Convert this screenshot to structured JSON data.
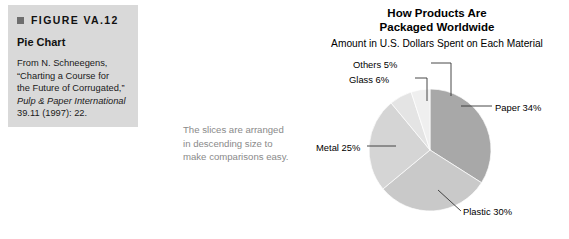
{
  "figure": {
    "marker": "square-bullet-icon",
    "number": "FIGURE VA.12",
    "title": "Pie Chart",
    "credit_line1": "From N. Schneegens,",
    "credit_line2": "“Charting a Course for",
    "credit_line3": "the Future of Corrugated,”",
    "credit_source": "Pulp & Paper International",
    "credit_line4": "39.11 (1997): 22."
  },
  "annotation": {
    "line1": "The slices are arranged",
    "line2": "in descending size to",
    "line3": "make comparisons easy."
  },
  "chart_data": {
    "type": "pie",
    "title": "How Products Are Packaged Worldwide",
    "title_line1": "How Products Are",
    "title_line2": "Packaged Worldwide",
    "subtitle": "Amount in U.S. Dollars Spent on Each Material",
    "xlabel": "",
    "ylabel": "",
    "legend_position": "none",
    "grid": false,
    "categories": [
      "Paper",
      "Plastic",
      "Metal",
      "Glass",
      "Others"
    ],
    "values": [
      34,
      30,
      25,
      6,
      5
    ],
    "unit": "%",
    "labels": [
      "Paper 34%",
      "Plastic 30%",
      "Metal 25%",
      "Glass 6%",
      "Others 5%"
    ],
    "colors": [
      "#a8a8a8",
      "#c9c9c9",
      "#d5d5d5",
      "#e4e4e4",
      "#efefef"
    ],
    "start_angle_deg": 0,
    "direction": "clockwise",
    "center": [
      430,
      150
    ],
    "radius": 61
  }
}
